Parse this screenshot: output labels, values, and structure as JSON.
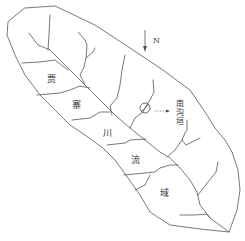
{
  "map": {
    "title": "贾寨川流域",
    "region_chars": [
      "贾",
      "寨",
      "川",
      "流",
      "域"
    ],
    "north_label": "N",
    "marker_label": "南沟垣",
    "colors": {
      "line": "#555555",
      "text": "#333333",
      "background": "#ffffff"
    }
  }
}
